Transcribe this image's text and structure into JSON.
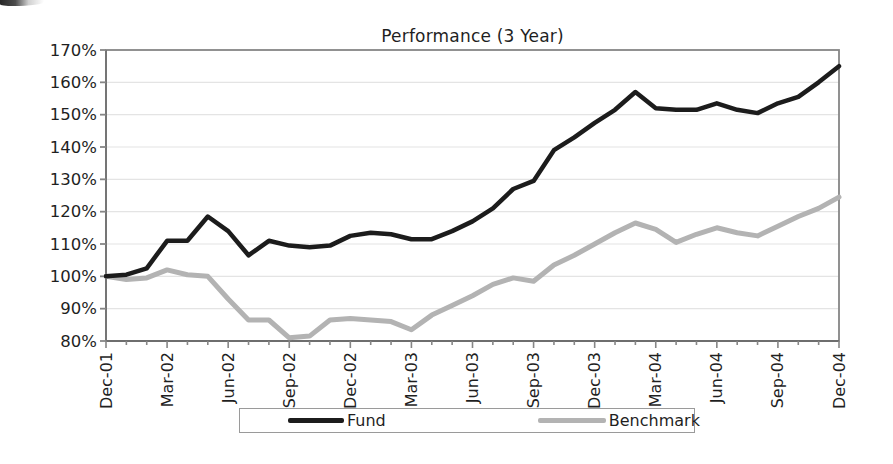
{
  "chart_data": {
    "type": "line",
    "title": "Performance (3 Year)",
    "x_tick_labels": [
      "Dec-01",
      "Mar-02",
      "Jun-02",
      "Sep-02",
      "Dec-02",
      "Mar-03",
      "Jun-03",
      "Sep-03",
      "Dec-03",
      "Mar-04",
      "Jun-04",
      "Sep-04",
      "Dec-04"
    ],
    "points_per_labeled_tick": 3,
    "x_unit": "month",
    "y_tick_labels": [
      "80%",
      "90%",
      "100%",
      "110%",
      "120%",
      "130%",
      "140%",
      "150%",
      "160%",
      "170%"
    ],
    "ylim": [
      80,
      170
    ],
    "ytick_step": 10,
    "grid": "horizontal-only",
    "legend_position": "bottom-center",
    "axis_color": "#868686",
    "grid_color": "#e4e4e4",
    "text_color": "#1f1f1f",
    "series": [
      {
        "name": "Fund",
        "color": "#1c1c1c",
        "stroke_width": 4.5,
        "values": [
          100,
          100.5,
          102.5,
          111,
          111,
          118.5,
          114,
          106.5,
          111,
          109.5,
          109,
          109.5,
          112.5,
          113.5,
          113,
          111.5,
          111.5,
          114,
          117,
          121,
          127,
          129.5,
          139,
          143,
          147.5,
          151.5,
          157,
          152,
          151.5,
          151.5,
          153.5,
          151.5,
          150.5,
          153.5,
          155.5,
          160,
          165
        ]
      },
      {
        "name": "Benchmark",
        "color": "#b3b3b3",
        "stroke_width": 5,
        "values": [
          100,
          99,
          99.5,
          102,
          100.5,
          100,
          93,
          86.5,
          86.5,
          81,
          81.5,
          86.5,
          87,
          86.5,
          86,
          83.5,
          88,
          91,
          94,
          97.5,
          99.5,
          98.5,
          103.5,
          106.5,
          110,
          113.5,
          116.5,
          114.5,
          110.5,
          113,
          115,
          113.5,
          112.5,
          115.5,
          118.5,
          121,
          124.5
        ]
      }
    ]
  }
}
